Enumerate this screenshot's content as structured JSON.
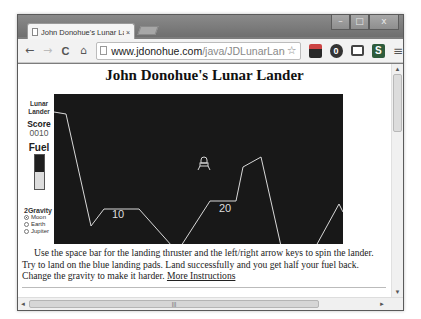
{
  "browser": {
    "tab_title": "John Donohue's Lunar Lar",
    "tab_close": "×",
    "url_host": "www.jdonohue.com",
    "url_path": "/java/JDLunarLander/JDLt",
    "nav": {
      "back": "←",
      "forward": "→",
      "reload": "C",
      "home": "⌂"
    },
    "star_icon": "☆",
    "menu_icon": "≡",
    "window_controls": {
      "minimize": "–",
      "maximize": "□",
      "close": "x"
    },
    "extensions": [
      {
        "name": "landscape-extension-icon",
        "glyph": ""
      },
      {
        "name": "circle-extension-icon",
        "glyph": "0"
      },
      {
        "name": "cast-icon",
        "glyph": ""
      },
      {
        "name": "s-extension-icon",
        "glyph": "S"
      }
    ]
  },
  "page": {
    "title": "John Donohue's Lunar Lander",
    "sidebar": {
      "game_label_line1": "Lunar",
      "game_label_line2": "Lander",
      "score_label": "Score",
      "score_value": "0010",
      "fuel_label": "Fuel",
      "fuel_percent": 50,
      "gravity_label": "2Gravity",
      "gravity_options": [
        {
          "label": "Moon",
          "selected": true
        },
        {
          "label": "Earth",
          "selected": false
        },
        {
          "label": "Jupiter",
          "selected": false
        }
      ]
    },
    "game": {
      "background": "#181818",
      "line_color": "#d8d8d8",
      "landing_pads": [
        {
          "label": "10"
        },
        {
          "label": "20"
        }
      ]
    },
    "instructions_text": "Use the space bar for the landing thruster and the left/right arrow keys to spin the lander. Try to land on the blue landing pads. Land successfully and you get half your fuel back. Change the gravity to make it harder.",
    "more_instructions_link": "More Instructions"
  },
  "scrollbars": {
    "up": "▲",
    "down": "▼",
    "left": "◄",
    "right": "►",
    "grip": "|||"
  }
}
